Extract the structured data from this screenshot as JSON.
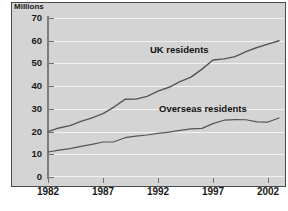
{
  "chart_data": {
    "type": "line",
    "title": "",
    "subtitle": "",
    "xlabel": "",
    "ylabel": "Millions",
    "ylim": [
      0,
      70
    ],
    "xlim": [
      1982,
      2003
    ],
    "grid": true,
    "legend_position": "inline-annotation",
    "yticks": [
      0,
      10,
      20,
      30,
      40,
      50,
      60,
      70
    ],
    "ytick_labels": [
      "0",
      "10",
      "20",
      "30",
      "40",
      "50",
      "60",
      "70"
    ],
    "xticks": [
      1982,
      1987,
      1992,
      1997,
      2002
    ],
    "xtick_labels": [
      "1982",
      "1987",
      "1992",
      "1997",
      "2002"
    ],
    "x": [
      1982,
      1983,
      1984,
      1985,
      1986,
      1987,
      1988,
      1989,
      1990,
      1991,
      1992,
      1993,
      1994,
      1995,
      1996,
      1997,
      1998,
      1999,
      2000,
      2001,
      2002,
      2003
    ],
    "series": [
      {
        "name": "UK residents",
        "color": "#555555",
        "values": [
          20.0,
          21.6,
          22.6,
          24.5,
          26.0,
          27.9,
          30.8,
          34.2,
          34.3,
          35.5,
          37.8,
          39.5,
          42.0,
          44.0,
          47.5,
          51.5,
          52.0,
          53.0,
          55.2,
          57.0,
          58.5,
          60.0
        ]
      },
      {
        "name": "Overseas residents",
        "color": "#555555",
        "values": [
          11.0,
          11.8,
          12.5,
          13.5,
          14.4,
          15.4,
          15.5,
          17.3,
          18.0,
          18.5,
          19.2,
          19.8,
          20.5,
          21.2,
          21.4,
          23.5,
          25.0,
          25.3,
          25.2,
          24.3,
          24.2,
          26.0
        ]
      }
    ],
    "annotations": [
      {
        "text": "UK residents",
        "x": 1992.5,
        "y": 45.5
      },
      {
        "text": "Overseas residents",
        "x": 1993.5,
        "y": 30.0
      }
    ]
  },
  "figure": {
    "axis_label_y": "Millions",
    "background_color": "#d4d4d4",
    "gridline_color": "#f2f2f2",
    "axis_color": "#7d7d7d",
    "line_color": "#555555",
    "border_color": "#4a4a4a"
  }
}
